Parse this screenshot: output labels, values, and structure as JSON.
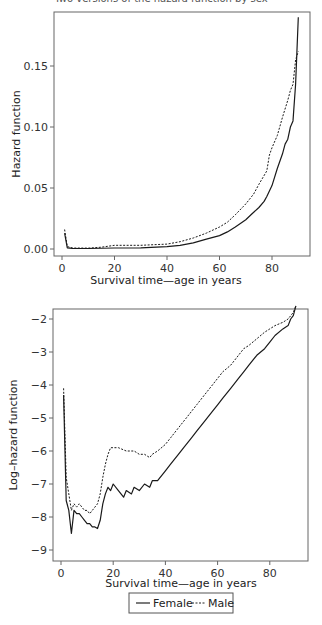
{
  "header": {
    "cut_title": "Two versions of the hazard function by sex"
  },
  "chart_data": [
    {
      "type": "line",
      "title": "",
      "xlabel": "Survival time—age in years",
      "ylabel": "Hazard function",
      "xlim": [
        -2,
        94
      ],
      "ylim": [
        -0.006,
        0.194
      ],
      "x_ticks": [
        0,
        20,
        40,
        60,
        80
      ],
      "x_tick_labels": [
        "0",
        "20",
        "40",
        "60",
        "80"
      ],
      "y_ticks": [
        0.0,
        0.05,
        0.1,
        0.15
      ],
      "y_tick_labels": [
        "0.00",
        "0.05",
        "0.10",
        "0.15"
      ],
      "grid": false,
      "series": [
        {
          "name": "Female",
          "style": "solid",
          "x": [
            1,
            2,
            4,
            10,
            20,
            30,
            40,
            45,
            50,
            55,
            60,
            63,
            66,
            70,
            72,
            75,
            77,
            78,
            80,
            82,
            84,
            85,
            86,
            87,
            88,
            89,
            90
          ],
          "y": [
            0.013,
            0.001,
            0.0005,
            0.0004,
            0.0008,
            0.001,
            0.002,
            0.003,
            0.005,
            0.008,
            0.011,
            0.014,
            0.018,
            0.024,
            0.028,
            0.034,
            0.039,
            0.043,
            0.052,
            0.066,
            0.078,
            0.086,
            0.09,
            0.1,
            0.105,
            0.135,
            0.19
          ]
        },
        {
          "name": "Male",
          "style": "dashed",
          "x": [
            1,
            2,
            4,
            10,
            15,
            20,
            30,
            40,
            45,
            50,
            55,
            60,
            63,
            66,
            70,
            73,
            75,
            78,
            79,
            80,
            82,
            84,
            86,
            87,
            88,
            89,
            90
          ],
          "y": [
            0.016,
            0.002,
            0.0008,
            0.0007,
            0.0015,
            0.003,
            0.003,
            0.004,
            0.006,
            0.009,
            0.013,
            0.018,
            0.022,
            0.028,
            0.037,
            0.045,
            0.053,
            0.064,
            0.077,
            0.083,
            0.093,
            0.108,
            0.122,
            0.13,
            0.135,
            0.155,
            0.162
          ]
        }
      ]
    },
    {
      "type": "line",
      "title": "",
      "xlabel": "Survival time—age in years",
      "ylabel": "Log–hazard function",
      "xlim": [
        -2,
        95
      ],
      "ylim": [
        -9.3,
        -1.7
      ],
      "x_ticks": [
        0,
        20,
        40,
        60,
        80
      ],
      "x_tick_labels": [
        "0",
        "20",
        "40",
        "60",
        "80"
      ],
      "y_ticks": [
        -2,
        -3,
        -4,
        -5,
        -6,
        -7,
        -8,
        -9
      ],
      "y_tick_labels": [
        "−2",
        "−3",
        "−4",
        "−5",
        "−6",
        "−7",
        "−8",
        "−9"
      ],
      "grid": false,
      "legend": {
        "position": "bottom-center",
        "entries": [
          "Female",
          "Male"
        ]
      },
      "series": [
        {
          "name": "Female",
          "style": "solid",
          "x": [
            1,
            2,
            3,
            4,
            5,
            6,
            7,
            8,
            9,
            10,
            11,
            12,
            13,
            14,
            15,
            16,
            17,
            18,
            19,
            20,
            22,
            24,
            25,
            27,
            28,
            30,
            32,
            34,
            35,
            37,
            40,
            42,
            45,
            47,
            50,
            52,
            55,
            58,
            60,
            62,
            65,
            68,
            70,
            72,
            75,
            78,
            80,
            82,
            85,
            87,
            88,
            89,
            90
          ],
          "y": [
            -4.3,
            -7.5,
            -7.8,
            -8.5,
            -7.8,
            -7.9,
            -7.9,
            -8.0,
            -8.1,
            -8.2,
            -8.2,
            -8.3,
            -8.3,
            -8.35,
            -8.1,
            -7.6,
            -7.3,
            -7.1,
            -7.2,
            -7.0,
            -7.2,
            -7.4,
            -7.2,
            -7.3,
            -7.1,
            -7.2,
            -7.0,
            -7.1,
            -6.9,
            -6.9,
            -6.6,
            -6.4,
            -6.1,
            -5.9,
            -5.6,
            -5.4,
            -5.1,
            -4.8,
            -4.6,
            -4.4,
            -4.1,
            -3.8,
            -3.6,
            -3.4,
            -3.1,
            -2.9,
            -2.7,
            -2.5,
            -2.3,
            -2.2,
            -2.0,
            -1.9,
            -1.6
          ]
        },
        {
          "name": "Male",
          "style": "dashed",
          "x": [
            1,
            2,
            3,
            4,
            5,
            6,
            7,
            8,
            9,
            10,
            11,
            12,
            13,
            14,
            15,
            16,
            17,
            18,
            19,
            20,
            22,
            25,
            28,
            30,
            32,
            34,
            35,
            37,
            40,
            42,
            45,
            48,
            50,
            52,
            55,
            58,
            60,
            62,
            65,
            68,
            70,
            72,
            75,
            78,
            80,
            82,
            85,
            87,
            88,
            89,
            90
          ],
          "y": [
            -4.1,
            -6.8,
            -7.3,
            -7.8,
            -7.6,
            -7.7,
            -7.6,
            -7.7,
            -7.8,
            -7.8,
            -7.9,
            -7.8,
            -7.7,
            -7.6,
            -7.3,
            -6.8,
            -6.4,
            -6.1,
            -5.9,
            -5.9,
            -5.9,
            -6.0,
            -6.0,
            -6.1,
            -6.1,
            -6.2,
            -6.1,
            -6.0,
            -5.8,
            -5.6,
            -5.3,
            -5.0,
            -4.8,
            -4.6,
            -4.3,
            -4.0,
            -3.8,
            -3.6,
            -3.4,
            -3.1,
            -2.9,
            -2.8,
            -2.6,
            -2.4,
            -2.3,
            -2.2,
            -2.1,
            -2.0,
            -1.9,
            -1.8,
            -1.6
          ]
        }
      ]
    }
  ],
  "legend": {
    "female_label": "Female",
    "male_label": "Male"
  }
}
